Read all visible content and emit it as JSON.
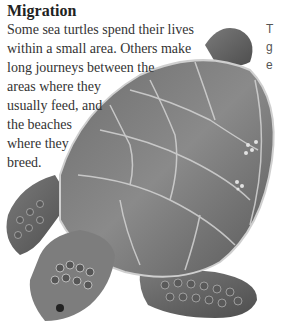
{
  "article": {
    "heading": "Migration",
    "paragraph_lines": [
      "Some sea turtles spend their lives",
      "within a small area. Others make",
      "long journeys between the",
      "areas where they",
      "usually feed, and",
      "the beaches",
      "where they",
      "breed."
    ]
  },
  "side_column": {
    "lines": [
      "T",
      "g",
      "e"
    ]
  },
  "illustration": {
    "subject": "sea-turtle",
    "description": "Grayscale illustration of a sea turtle seen from above, head toward lower left"
  }
}
